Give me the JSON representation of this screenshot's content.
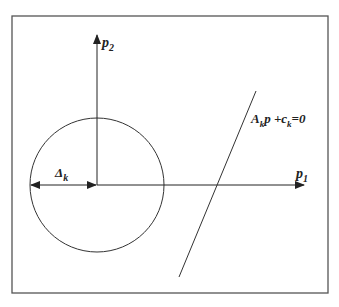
{
  "diagram": {
    "axes": {
      "horizontal_label": "p",
      "horizontal_sub": "1",
      "vertical_label": "p",
      "vertical_sub": "2"
    },
    "radius_label": "Δ",
    "radius_sub": "k",
    "constraint": {
      "A": "A",
      "A_sub": "k",
      "p": "p +c",
      "c_sub": "k",
      "rhs": "=0"
    },
    "colors": {
      "stroke": "#333333",
      "frame": "#555555"
    }
  }
}
